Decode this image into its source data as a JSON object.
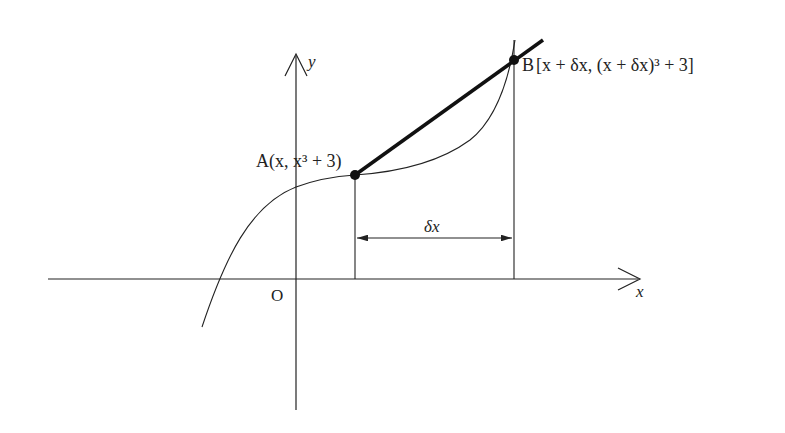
{
  "diagram": {
    "colors": {
      "stroke": "#222222",
      "background": "#ffffff"
    },
    "axes": {
      "x_label": "x",
      "y_label": "y",
      "origin_label": "O"
    },
    "points": {
      "A": {
        "name": "A",
        "coords": "(x, x³ + 3)"
      },
      "B": {
        "name": "B",
        "coords": "[x + δx, (x + δx)³ + 3]"
      }
    },
    "interval_label": "δx"
  }
}
